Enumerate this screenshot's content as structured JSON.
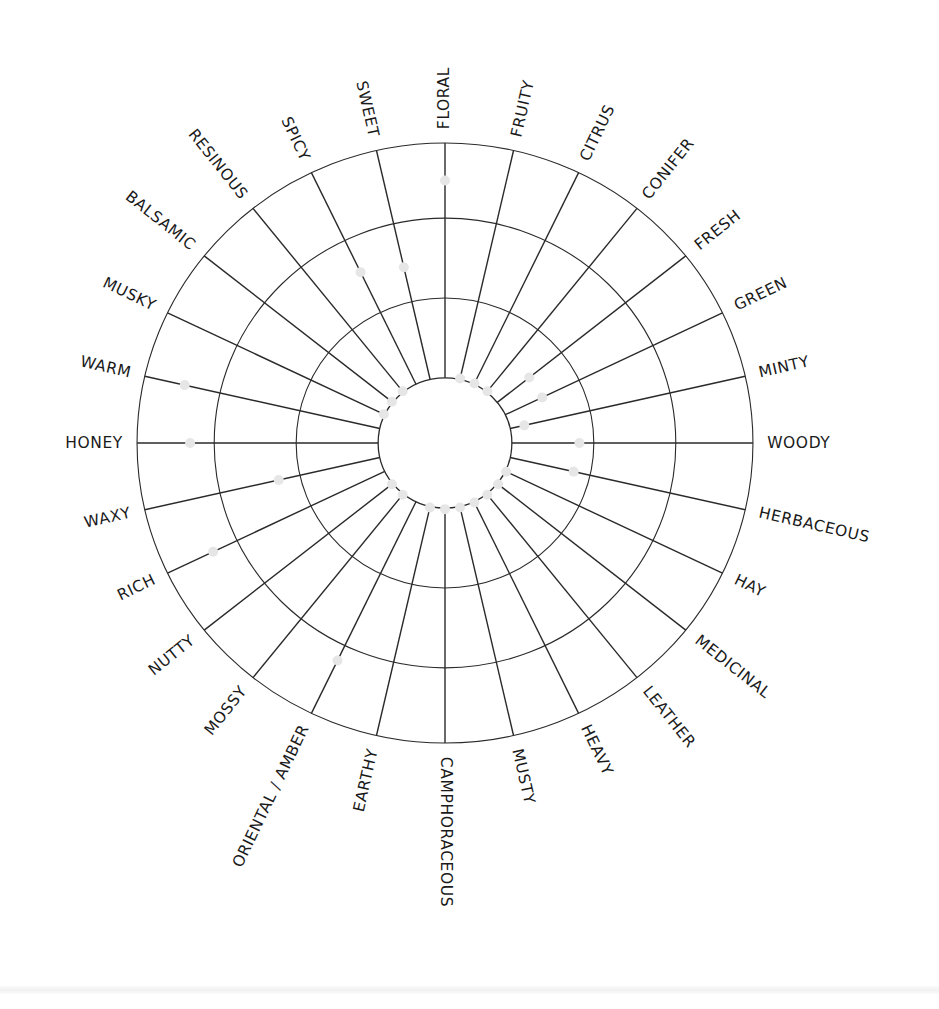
{
  "chart_data": {
    "type": "radial",
    "title": "",
    "scale": {
      "min": 0,
      "max": 10,
      "rings": [
        0,
        3.4,
        6.8,
        10
      ],
      "note": "0 = inner circle, 10 = outer circle"
    },
    "start_angle_deg": 0,
    "direction": "clockwise",
    "categories": [
      "FLORAL",
      "FRUITY",
      "CITRUS",
      "CONIFER",
      "FRESH",
      "GREEN",
      "MINTY",
      "WOODY",
      "HERBACEOUS",
      "HAY",
      "MEDICINAL",
      "LEATHER",
      "HEAVY",
      "MUSTY",
      "CAMPHORACEOUS",
      "EARTHY",
      "ORIENTAL / AMBER",
      "MOSSY",
      "NUTTY",
      "RICH",
      "WAXY",
      "HONEY",
      "WARM",
      "MUSKY",
      "BALSAMIC",
      "RESINOUS",
      "SPICY",
      "SWEET"
    ],
    "values": [
      8.4,
      0.0,
      0.0,
      0.0,
      1.7,
      1.7,
      0.6,
      2.8,
      2.7,
      0.0,
      0.0,
      0.0,
      0.0,
      0.0,
      0.0,
      0.0,
      7.5,
      0.0,
      0.0,
      7.9,
      4.3,
      7.8,
      8.3,
      0.0,
      0.0,
      0.0,
      5.3,
      4.9
    ],
    "grid": true,
    "legend": null
  },
  "style": {
    "line_color": "#2a2a2a",
    "dot_color": "#e6e6e6",
    "label_color": "#1a1a1a"
  }
}
